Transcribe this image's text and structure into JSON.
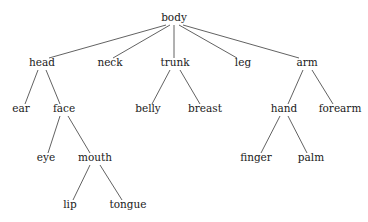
{
  "diagram": {
    "type": "tree",
    "background_color": "#ffffff",
    "line_color": "#3a3a3a",
    "text_color": "#1a1a1a",
    "root": "body",
    "nodes": [
      {
        "id": "body",
        "label": "body",
        "x": 174,
        "y": 21,
        "depth": 0
      },
      {
        "id": "head",
        "label": "head",
        "x": 42,
        "y": 66,
        "depth": 1
      },
      {
        "id": "neck",
        "label": "neck",
        "x": 110,
        "y": 66,
        "depth": 1
      },
      {
        "id": "trunk",
        "label": "trunk",
        "x": 175,
        "y": 66,
        "depth": 1
      },
      {
        "id": "leg",
        "label": "leg",
        "x": 243,
        "y": 66,
        "depth": 1
      },
      {
        "id": "arm",
        "label": "arm",
        "x": 307,
        "y": 66,
        "depth": 1
      },
      {
        "id": "ear",
        "label": "ear",
        "x": 21,
        "y": 112,
        "depth": 2
      },
      {
        "id": "face",
        "label": "face",
        "x": 64,
        "y": 112,
        "depth": 2
      },
      {
        "id": "belly",
        "label": "belly",
        "x": 148,
        "y": 112,
        "depth": 2
      },
      {
        "id": "breast",
        "label": "breast",
        "x": 205,
        "y": 112,
        "depth": 2
      },
      {
        "id": "hand",
        "label": "hand",
        "x": 284,
        "y": 112,
        "depth": 2
      },
      {
        "id": "forearm",
        "label": "forearm",
        "x": 340,
        "y": 112,
        "depth": 2
      },
      {
        "id": "eye",
        "label": "eye",
        "x": 46,
        "y": 161,
        "depth": 3
      },
      {
        "id": "mouth",
        "label": "mouth",
        "x": 95,
        "y": 161,
        "depth": 3
      },
      {
        "id": "finger",
        "label": "finger",
        "x": 256,
        "y": 161,
        "depth": 3
      },
      {
        "id": "palm",
        "label": "palm",
        "x": 311,
        "y": 161,
        "depth": 3
      },
      {
        "id": "lip",
        "label": "lip",
        "x": 70,
        "y": 208,
        "depth": 4
      },
      {
        "id": "tongue",
        "label": "tongue",
        "x": 128,
        "y": 208,
        "depth": 4
      }
    ],
    "edges": [
      {
        "from": "body",
        "to": "head",
        "x1": 166,
        "y1": 25,
        "x2": 49,
        "y2": 58
      },
      {
        "from": "body",
        "to": "neck",
        "x1": 170,
        "y1": 25,
        "x2": 113,
        "y2": 58
      },
      {
        "from": "body",
        "to": "trunk",
        "x1": 174,
        "y1": 25,
        "x2": 174,
        "y2": 58
      },
      {
        "from": "body",
        "to": "leg",
        "x1": 179,
        "y1": 25,
        "x2": 237,
        "y2": 58
      },
      {
        "from": "body",
        "to": "arm",
        "x1": 183,
        "y1": 25,
        "x2": 299,
        "y2": 58
      },
      {
        "from": "head",
        "to": "ear",
        "x1": 38,
        "y1": 70,
        "x2": 25,
        "y2": 104
      },
      {
        "from": "head",
        "to": "face",
        "x1": 46,
        "y1": 70,
        "x2": 60,
        "y2": 104
      },
      {
        "from": "trunk",
        "to": "belly",
        "x1": 170,
        "y1": 70,
        "x2": 152,
        "y2": 104
      },
      {
        "from": "trunk",
        "to": "breast",
        "x1": 180,
        "y1": 70,
        "x2": 200,
        "y2": 104
      },
      {
        "from": "arm",
        "to": "hand",
        "x1": 303,
        "y1": 70,
        "x2": 288,
        "y2": 104
      },
      {
        "from": "arm",
        "to": "forearm",
        "x1": 312,
        "y1": 70,
        "x2": 333,
        "y2": 104
      },
      {
        "from": "face",
        "to": "eye",
        "x1": 60,
        "y1": 116,
        "x2": 48,
        "y2": 153
      },
      {
        "from": "face",
        "to": "mouth",
        "x1": 68,
        "y1": 116,
        "x2": 90,
        "y2": 153
      },
      {
        "from": "hand",
        "to": "finger",
        "x1": 280,
        "y1": 116,
        "x2": 261,
        "y2": 153
      },
      {
        "from": "hand",
        "to": "palm",
        "x1": 288,
        "y1": 116,
        "x2": 307,
        "y2": 153
      },
      {
        "from": "mouth",
        "to": "lip",
        "x1": 90,
        "y1": 165,
        "x2": 73,
        "y2": 200
      },
      {
        "from": "mouth",
        "to": "tongue",
        "x1": 100,
        "y1": 165,
        "x2": 122,
        "y2": 200
      }
    ]
  }
}
